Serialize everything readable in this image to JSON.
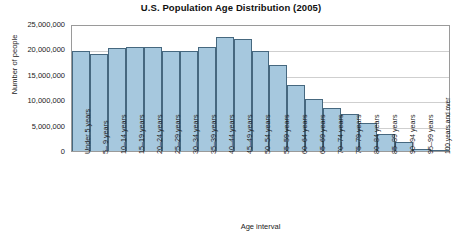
{
  "chart_data": {
    "type": "bar",
    "title": "U.S. Population Age Distribution (2005)",
    "xlabel": "Age interval",
    "ylabel": "Number of people",
    "ylim": [
      0,
      25000000
    ],
    "ytick_labels": [
      "25,000,000",
      "20,000,000",
      "15,000,000",
      "10,000,000",
      "5,000,000",
      "0"
    ],
    "ytick_values": [
      25000000,
      20000000,
      15000000,
      10000000,
      5000000,
      0
    ],
    "grid": true,
    "legend": "none",
    "bar_fill_color": "#a6c8de",
    "bar_border_color": "#46687f",
    "categories": [
      "Under 5 years",
      "5– 9 years",
      "10–14 years",
      "15–19 years",
      "20–24 years",
      "25–29 years",
      "30–34 years",
      "35–39 years",
      "40–44 years",
      "45–49 years",
      "50–54 years",
      "55–59 years",
      "60–64 years",
      "65–69 years",
      "70–74 years",
      "75–79 years",
      "80–84 years",
      "85–89 years",
      "90–94 years",
      "95–99 years",
      "100 years and over"
    ],
    "values": [
      20000000,
      19500000,
      20600000,
      20800000,
      20800000,
      20000000,
      20000000,
      20900000,
      22900000,
      22400000,
      20000000,
      17300000,
      13300000,
      10500000,
      8700000,
      7400000,
      5700000,
      3500000,
      1800000,
      500000,
      100000
    ]
  }
}
